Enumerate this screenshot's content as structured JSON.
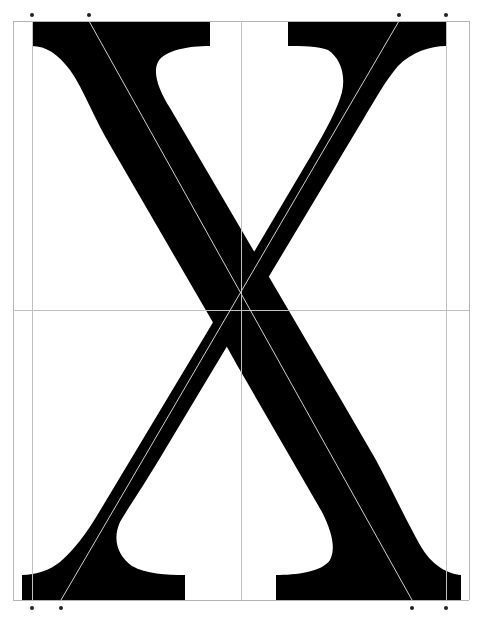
{
  "figure": {
    "subject": "Construction diagram of a serif capital letter",
    "glyph": "X",
    "colors": {
      "background": "#ffffff",
      "glyph_fill": "#000000",
      "frame_line": "#b4b4b4",
      "guide_line": "#c8c8c8",
      "marker_dot": "#222222"
    },
    "frame": {
      "left": 13,
      "top": 21,
      "right": 469,
      "bottom": 600
    },
    "vertical_guides": [
      32,
      241,
      446
    ],
    "horizontal_guides": [
      310
    ],
    "diagonal_guides": [
      {
        "x1": 89,
        "y1": 21,
        "x2": 412,
        "y2": 600
      },
      {
        "x1": 399,
        "y1": 21,
        "x2": 61,
        "y2": 600
      }
    ],
    "top_markers": [
      {
        "x": 32,
        "y": 15
      },
      {
        "x": 89,
        "y": 15
      },
      {
        "x": 399,
        "y": 15
      },
      {
        "x": 446,
        "y": 15
      }
    ],
    "bottom_markers": [
      {
        "x": 32,
        "y": 608
      },
      {
        "x": 61,
        "y": 608
      },
      {
        "x": 412,
        "y": 608
      },
      {
        "x": 446,
        "y": 608
      }
    ]
  }
}
